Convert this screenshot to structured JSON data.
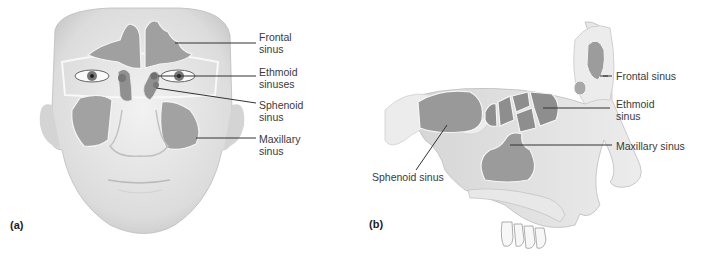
{
  "colors": {
    "skin": "#e6e6e6",
    "skin_shadow": "#cfcfcf",
    "sinus": "#9a9a9a",
    "sinus_dark": "#808080",
    "bone": "#ededed",
    "leader": "#333333",
    "text": "#3a3a3a"
  },
  "panel_a": {
    "letter": "(a)",
    "labels": [
      {
        "id": "frontal",
        "text": "Frontal\nsinus"
      },
      {
        "id": "ethmoid",
        "text": "Ethmoid\nsinuses"
      },
      {
        "id": "sphenoid",
        "text": "Sphenoid\nsinus"
      },
      {
        "id": "maxillary",
        "text": "Maxillary\nsinus"
      }
    ]
  },
  "panel_b": {
    "letter": "(b)",
    "labels": [
      {
        "id": "frontal",
        "text": "Frontal sinus"
      },
      {
        "id": "ethmoid",
        "text": "Ethmoid\nsinus"
      },
      {
        "id": "maxillary",
        "text": "Maxillary sinus"
      },
      {
        "id": "sphenoid",
        "text": "Sphenoid sinus"
      }
    ]
  }
}
